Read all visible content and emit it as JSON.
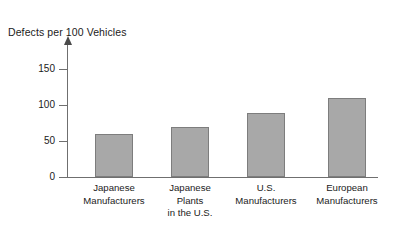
{
  "chart_data": {
    "type": "bar",
    "title": "Defects per 100 Vehicles",
    "xlabel": "",
    "ylabel": "Defects per 100 Vehicles",
    "categories": [
      "Japanese Manufacturers",
      "Japanese Plants in the U.S.",
      "U.S. Manufacturers",
      "European Manufacturers"
    ],
    "category_lines": [
      [
        "Japanese",
        "Manufacturers"
      ],
      [
        "Japanese",
        "Plants",
        "in the U.S."
      ],
      [
        "U.S.",
        "Manufacturers"
      ],
      [
        "European",
        "Manufacturers"
      ]
    ],
    "values": [
      60,
      70,
      89,
      110
    ],
    "ylim": [
      0,
      165
    ],
    "yticks": [
      0,
      50,
      100,
      150
    ],
    "ytick_labels": [
      "0",
      "50",
      "100",
      "150"
    ],
    "grid": false,
    "legend": false,
    "bar_color": "#a8a8a8",
    "bar_edge_color": "#7d7d7d",
    "axis_color": "#6f6f6f",
    "text_color": "#1b1b1b",
    "background": "#ffffff"
  }
}
